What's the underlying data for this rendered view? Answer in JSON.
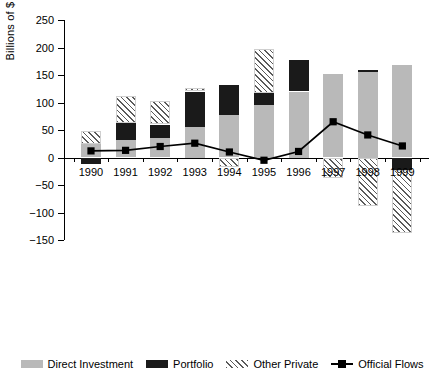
{
  "chart_data": {
    "type": "bar",
    "title": "",
    "xlabel": "",
    "ylabel": "Billions of $",
    "ylim": [
      -150,
      250
    ],
    "yticks": [
      250,
      200,
      150,
      100,
      50,
      0,
      -50,
      -100,
      -150
    ],
    "ytick_labels": [
      "250",
      "200",
      "150",
      "100",
      "50",
      "0",
      "−50",
      "−100",
      "−150"
    ],
    "grid": false,
    "stacked": true,
    "legend_position": "bottom",
    "categories": [
      "1990",
      "1991",
      "1992",
      "1993",
      "1994",
      "1995",
      "1996",
      "1997",
      "1998",
      "1999"
    ],
    "series": [
      {
        "name": "Direct Investment",
        "kind": "bar",
        "color": "#b9b9b9",
        "values": [
          24,
          31,
          36,
          55,
          78,
          95,
          120,
          152,
          155,
          168
        ]
      },
      {
        "name": "Portfolio",
        "kind": "bar",
        "color": "#1a1a1a",
        "values": [
          -12,
          32,
          24,
          65,
          53,
          22,
          57,
          0,
          5,
          -22
        ]
      },
      {
        "name": "Other Private",
        "kind": "bar",
        "color": "hatched",
        "values": [
          24,
          48,
          43,
          7,
          -18,
          80,
          0,
          -38,
          -88,
          -115
        ]
      },
      {
        "name": "Official Flows",
        "kind": "line",
        "color": "#000000",
        "values": [
          12,
          13,
          20,
          26,
          10,
          -5,
          11,
          65,
          41,
          21
        ]
      }
    ]
  },
  "legend": {
    "items": [
      {
        "label": "Direct Investment",
        "swatch": "direct"
      },
      {
        "label": "Portfolio",
        "swatch": "portfolio"
      },
      {
        "label": "Other Private",
        "swatch": "other"
      },
      {
        "label": "Official Flows",
        "swatch": "flows"
      }
    ]
  }
}
